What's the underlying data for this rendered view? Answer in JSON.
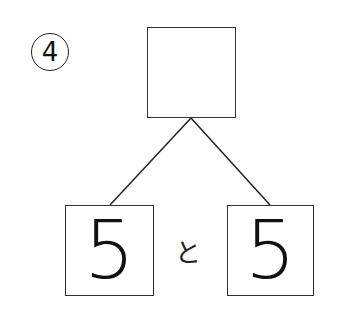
{
  "problem": {
    "number_label": "4",
    "top_box": {
      "value": ""
    },
    "left_box": {
      "value": "5"
    },
    "right_box": {
      "value": "5"
    },
    "connector": "と"
  }
}
